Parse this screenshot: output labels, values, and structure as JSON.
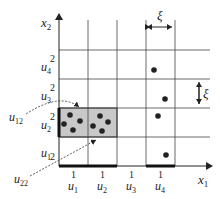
{
  "diagram": {
    "axes": {
      "x_label": "x",
      "x_sub": "1",
      "y_label": "x",
      "y_sub": "2"
    },
    "x_intervals": [
      {
        "sup": "1",
        "name": "u",
        "sub": "1"
      },
      {
        "sup": "1",
        "name": "u",
        "sub": "2"
      },
      {
        "sup": "1",
        "name": "u",
        "sub": "3"
      },
      {
        "sup": "1",
        "name": "u",
        "sub": "4"
      }
    ],
    "y_intervals": [
      {
        "sup": "2",
        "name": "u",
        "sub": "1"
      },
      {
        "sup": "2",
        "name": "u",
        "sub": "2"
      },
      {
        "sup": "2",
        "name": "u",
        "sub": "3"
      },
      {
        "sup": "2",
        "name": "u",
        "sub": "4"
      }
    ],
    "width_label": "ξ",
    "height_label": "ξ",
    "callouts": [
      {
        "name": "u",
        "sub": "12"
      },
      {
        "name": "u",
        "sub": "22"
      }
    ],
    "colors": {
      "highlight_fill": "#c8c8c8",
      "line": "#333333",
      "dot": "#222222"
    }
  }
}
